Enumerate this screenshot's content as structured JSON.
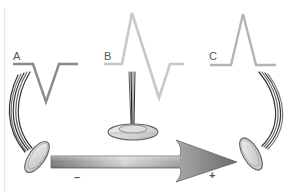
{
  "diagram": {
    "waveforms": [
      {
        "id": "A",
        "label": "A",
        "deflection": "negative",
        "color": "#8a8a8a"
      },
      {
        "id": "B",
        "label": "B",
        "deflection": "biphasic",
        "color": "#c4c4c4"
      },
      {
        "id": "C",
        "label": "C",
        "deflection": "positive",
        "color": "#b0b0b0"
      }
    ],
    "electrodes": [
      {
        "id": "A",
        "position": "left",
        "facing": "away"
      },
      {
        "id": "B",
        "position": "middle",
        "facing": "perpendicular"
      },
      {
        "id": "C",
        "position": "right",
        "facing": "toward"
      }
    ],
    "arrow": {
      "direction": "left-to-right",
      "start_label": "–",
      "end_label": "+"
    },
    "colors": {
      "arrow_dark": "#7a7a7a",
      "arrow_light": "#d8d8d8",
      "electrode_rim": "#6e6e6e",
      "electrode_face": "#e4e4e4",
      "wire": "#444444"
    }
  }
}
